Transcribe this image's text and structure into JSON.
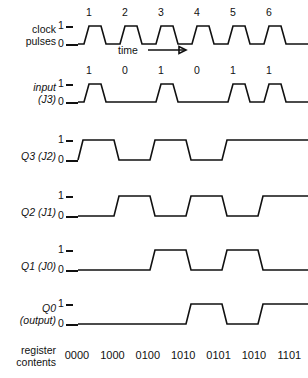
{
  "figure": {
    "time_label": "time",
    "level_high": "1",
    "level_low": "0"
  },
  "rows": [
    {
      "id": "clock",
      "label_line1": "clock",
      "label_line2": "pulses",
      "italic": false,
      "pulse_numbers": [
        "1",
        "2",
        "3",
        "4",
        "5",
        "6"
      ],
      "levels": [
        0,
        1,
        0,
        1,
        0,
        1,
        0,
        1,
        0,
        1,
        0,
        1,
        0
      ],
      "kind": "clock"
    },
    {
      "id": "input",
      "label_line1": "input",
      "label_line2": "(J3)",
      "italic": true,
      "bit_labels": [
        "1",
        "0",
        "1",
        "0",
        "1",
        "1"
      ],
      "bits": [
        1,
        0,
        1,
        0,
        1,
        1
      ],
      "kind": "pulse"
    },
    {
      "id": "q3",
      "label_line1": "",
      "label_line2": "Q3 (J2)",
      "italic": true,
      "bits": [
        1,
        0,
        1,
        0,
        1,
        1
      ],
      "kind": "level"
    },
    {
      "id": "q2",
      "label_line1": "",
      "label_line2": "Q2 (J1)",
      "italic": true,
      "bits": [
        0,
        1,
        0,
        1,
        0,
        1
      ],
      "kind": "level"
    },
    {
      "id": "q1",
      "label_line1": "",
      "label_line2": "Q1 (J0)",
      "italic": true,
      "bits": [
        0,
        0,
        1,
        0,
        1,
        0
      ],
      "kind": "level"
    },
    {
      "id": "q0",
      "label_line1": "Q0",
      "label_line2": "(output)",
      "italic": true,
      "bits": [
        0,
        0,
        0,
        1,
        0,
        1
      ],
      "kind": "level"
    }
  ],
  "register": {
    "label_line1": "register",
    "label_line2": "contents",
    "values": [
      "0000",
      "1000",
      "0100",
      "1010",
      "0101",
      "1010",
      "1101"
    ]
  }
}
